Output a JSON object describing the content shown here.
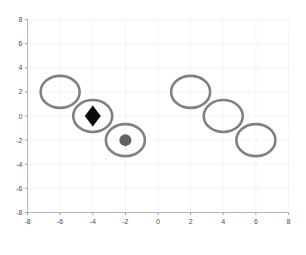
{
  "chart_data": {
    "type": "scatter",
    "title": "",
    "subtitle": "",
    "xlabel": "",
    "ylabel": "",
    "xlim": [
      -8,
      8
    ],
    "ylim": [
      -8,
      8
    ],
    "grid": true,
    "legend": "none",
    "x_ticks": [
      -8,
      -6,
      -4,
      -2,
      0,
      2,
      4,
      6,
      8
    ],
    "y_ticks": [
      -8,
      -6,
      -4,
      -2,
      0,
      2,
      4,
      6,
      8
    ],
    "x_tick_labels": [
      "-8",
      "-6",
      "-4",
      "-2",
      "0",
      "2",
      "4",
      "6",
      "8"
    ],
    "y_tick_labels": [
      "-8",
      "-6",
      "-4",
      "-2",
      "0",
      "2",
      "4",
      "6",
      "8"
    ],
    "series": [
      {
        "name": "ring",
        "marker": "open-circle",
        "color": "#808080",
        "points": [
          {
            "x": -6,
            "y": 2
          },
          {
            "x": -4,
            "y": 0
          },
          {
            "x": -2,
            "y": -2
          },
          {
            "x": 2,
            "y": 2
          },
          {
            "x": 4,
            "y": 0
          },
          {
            "x": 6,
            "y": -2
          }
        ]
      },
      {
        "name": "filled-diamond",
        "marker": "diamond",
        "color": "#0a0a0a",
        "points": [
          {
            "x": -4,
            "y": 0
          }
        ]
      },
      {
        "name": "filled-dot",
        "marker": "circle",
        "color": "#636363",
        "points": [
          {
            "x": -2,
            "y": -2
          }
        ]
      }
    ]
  },
  "axes": {
    "x_axis_name": "x-axis",
    "y_axis_name": "y-axis"
  }
}
